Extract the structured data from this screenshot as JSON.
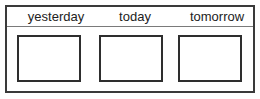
{
  "columns": [
    {
      "label": "yesterday"
    },
    {
      "label": "today"
    },
    {
      "label": "tomorrow"
    }
  ],
  "colors": {
    "border": "#3a3a3a",
    "divider": "#7a7a7a",
    "text": "#222222"
  }
}
